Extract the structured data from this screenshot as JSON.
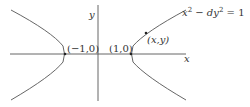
{
  "diagram": {
    "type": "hyperbola-plot",
    "equation": "x² − dy² = 1",
    "equation_parts": {
      "lhs_a": "x",
      "sup_a": "2",
      "op": " − ",
      "lhs_b": "dy",
      "sup_b": "2",
      "rhs": " = 1"
    },
    "axes": {
      "x_label": "x",
      "y_label": "y"
    },
    "points": [
      {
        "id": "left-vertex",
        "label": "(−1,0)"
      },
      {
        "id": "right-vertex",
        "label": "(1,0)"
      },
      {
        "id": "general-point",
        "label": "(x,y)"
      }
    ],
    "colors": {
      "stroke": "#555555",
      "text": "#333333",
      "background": "#ffffff"
    }
  }
}
